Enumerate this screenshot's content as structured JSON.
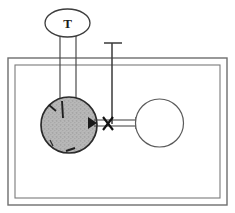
{
  "diagram": {
    "kind": "process-schematic",
    "canvas": {
      "width": 235,
      "height": 213,
      "background": "#ffffff"
    },
    "palette": {
      "stroke": "#4a4a4a",
      "stroke_dark": "#2b2b2b",
      "fill_shaded": "#b3b3b3",
      "fill_empty": "#ffffff",
      "frame_stroke": "#6e6e6e",
      "marker": "#1a1a1a"
    },
    "frame": {
      "name": "enclosure",
      "outer": {
        "x": 8,
        "y": 58,
        "width": 219,
        "height": 147
      },
      "inner": {
        "x": 15,
        "y": 65,
        "width": 205,
        "height": 133
      },
      "stroke_width": 1.3
    },
    "nodes": [
      {
        "id": "t-ellipse",
        "shape": "ellipse",
        "label": "T",
        "cx": 67.5,
        "cy": 23,
        "rx": 22.5,
        "ry": 14,
        "fill": "#ffffff",
        "stroke": "#3d3d3d"
      },
      {
        "id": "shaded-vessel",
        "shape": "circle",
        "label": "",
        "cx": 69,
        "cy": 125,
        "r": 28,
        "fill": "#b3b3b3",
        "stroke": "#2b2b2b"
      },
      {
        "id": "empty-vessel",
        "shape": "circle",
        "label": "",
        "cx": 159.5,
        "cy": 123,
        "r": 24,
        "fill": "#ffffff",
        "stroke": "#5a5a5a"
      }
    ],
    "connectors": [
      {
        "id": "downcomer-left",
        "kind": "vertical-line",
        "x": 60,
        "y1": 36,
        "y2": 115,
        "stroke": "#4a4a4a"
      },
      {
        "id": "downcomer-right",
        "kind": "vertical-line",
        "x": 76,
        "y1": 36,
        "y2": 110,
        "stroke": "#4a4a4a"
      },
      {
        "id": "standpipe",
        "kind": "vertical-line",
        "x": 112,
        "y1": 43,
        "y2": 124,
        "stroke": "#3a3a3a"
      },
      {
        "id": "standpipe-cap",
        "kind": "horizontal-line",
        "y": 43,
        "x1": 104,
        "x2": 122,
        "stroke": "#3a3a3a"
      },
      {
        "id": "crossover-top",
        "kind": "horizontal-line",
        "y": 120,
        "x1": 94,
        "x2": 136,
        "stroke": "#3a3a3a"
      },
      {
        "id": "crossover-bottom",
        "kind": "horizontal-line",
        "y": 126,
        "x1": 94,
        "x2": 136,
        "stroke": "#3a3a3a"
      }
    ],
    "markers": [
      {
        "id": "valve-cross",
        "kind": "x-marker",
        "cx": 108,
        "cy": 123,
        "size": 7,
        "stroke": "#111111"
      },
      {
        "id": "inlet-arrow",
        "kind": "arrowhead",
        "cx": 95,
        "cy": 123,
        "direction": "right"
      },
      {
        "id": "internal-tick-upper",
        "kind": "tick",
        "cx": 53,
        "cy": 108
      },
      {
        "id": "internal-tick-lower",
        "kind": "tick",
        "cx": 72,
        "cy": 150
      },
      {
        "id": "riser-tick",
        "kind": "tick",
        "cx": 62,
        "cy": 104
      }
    ],
    "labels": [
      {
        "id": "tank-label",
        "text": "T",
        "x": 67.5,
        "y": 28
      }
    ]
  }
}
